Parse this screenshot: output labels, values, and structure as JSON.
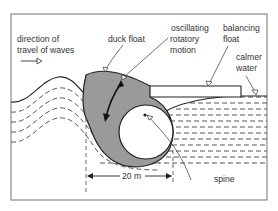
{
  "diagram": {
    "labels": {
      "direction_line1": "direction of",
      "direction_line2": "travel of waves",
      "duck_float": "duck float",
      "oscillating_line1": "oscillating",
      "oscillating_line2": "rotatory",
      "oscillating_line3": "motion",
      "balancing_line1": "balancing",
      "balancing_line2": "float",
      "calmer_line1": "calmer",
      "calmer_line2": "water",
      "dimension": "20 m",
      "spine": "spine"
    },
    "colors": {
      "frame": "#8a8a8a",
      "outline": "#222222",
      "duck_fill": "#9a9a9a",
      "water_dash": "#444444",
      "background": "#ffffff"
    }
  }
}
